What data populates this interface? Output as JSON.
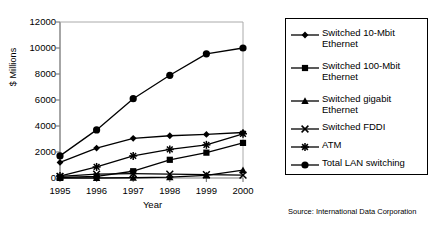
{
  "chart_data": {
    "type": "line",
    "title": "",
    "xlabel": "Year",
    "ylabel": "$ Millions",
    "categories": [
      "1995",
      "1996",
      "1997",
      "1998",
      "1999",
      "2000"
    ],
    "ylim": [
      0,
      12000
    ],
    "yticks": [
      0,
      2000,
      4000,
      6000,
      8000,
      10000,
      12000
    ],
    "ytick_labels": [
      "0",
      "2000",
      "4000",
      "6000",
      "8000",
      "10000",
      "12000"
    ],
    "grid": false,
    "legend_position": "right-outside",
    "series": [
      {
        "name": "Switched 10-Mbit\nEthernet",
        "marker": "diamond",
        "values": [
          1200,
          2300,
          3050,
          3250,
          3350,
          3500
        ]
      },
      {
        "name": "Switched 100-Mbit\nEthernet",
        "marker": "square",
        "values": [
          40,
          130,
          520,
          1400,
          1950,
          2700
        ]
      },
      {
        "name": "Switched gigabit\nEthernet",
        "marker": "triangle",
        "values": [
          0,
          0,
          20,
          60,
          200,
          600
        ]
      },
      {
        "name": "Switched FDDI",
        "marker": "cross",
        "values": [
          130,
          300,
          330,
          300,
          260,
          220
        ]
      },
      {
        "name": "ATM",
        "marker": "star",
        "values": [
          150,
          850,
          1700,
          2200,
          2550,
          3400
        ]
      },
      {
        "name": "Total LAN switching",
        "marker": "circle",
        "values": [
          1700,
          3700,
          6100,
          7900,
          9550,
          10000
        ]
      }
    ],
    "annotations": {
      "source": "Source: International Data Corporation"
    },
    "colors": {
      "line": "#000000",
      "marker": "#000000",
      "axis": "#808080",
      "background": "#ffffff"
    }
  }
}
